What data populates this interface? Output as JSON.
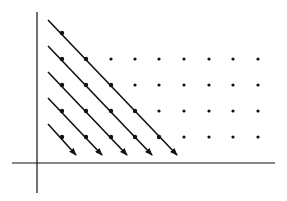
{
  "diagram": {
    "colors": {
      "ink": "#111111",
      "background": "#ffffff"
    },
    "axes": {
      "x_axis": {
        "x1": 12,
        "x2": 275,
        "y": 163
      },
      "y_axis": {
        "x": 37,
        "y1": 12,
        "y2": 193
      }
    },
    "grid": {
      "columns_x": [
        62,
        86,
        111,
        135,
        159,
        184,
        209,
        233,
        258
      ],
      "rows_y": [
        33,
        59,
        85,
        111,
        137
      ]
    },
    "arrows": [
      {
        "x1": 48,
        "y1": 20,
        "x2": 177,
        "y2": 155
      },
      {
        "x1": 48,
        "y1": 46,
        "x2": 152,
        "y2": 155
      },
      {
        "x1": 48,
        "y1": 72,
        "x2": 127,
        "y2": 155
      },
      {
        "x1": 48,
        "y1": 98,
        "x2": 102,
        "y2": 155
      },
      {
        "x1": 48,
        "y1": 124,
        "x2": 76,
        "y2": 155
      }
    ],
    "on_line_points": [
      [
        62,
        33
      ],
      [
        86,
        59
      ],
      [
        111,
        85
      ],
      [
        135,
        111
      ],
      [
        159,
        137
      ],
      [
        62,
        59
      ],
      [
        86,
        85
      ],
      [
        111,
        111
      ],
      [
        135,
        137
      ],
      [
        62,
        85
      ],
      [
        86,
        111
      ],
      [
        111,
        137
      ],
      [
        62,
        111
      ],
      [
        86,
        137
      ],
      [
        62,
        137
      ]
    ],
    "free_points": [
      [
        111,
        59
      ],
      [
        135,
        59
      ],
      [
        159,
        59
      ],
      [
        184,
        59
      ],
      [
        209,
        59
      ],
      [
        233,
        59
      ],
      [
        258,
        59
      ],
      [
        135,
        85
      ],
      [
        159,
        85
      ],
      [
        184,
        85
      ],
      [
        209,
        85
      ],
      [
        233,
        85
      ],
      [
        258,
        85
      ],
      [
        159,
        111
      ],
      [
        184,
        111
      ],
      [
        209,
        111
      ],
      [
        233,
        111
      ],
      [
        258,
        111
      ],
      [
        184,
        137
      ],
      [
        209,
        137
      ],
      [
        233,
        137
      ],
      [
        258,
        137
      ]
    ]
  }
}
